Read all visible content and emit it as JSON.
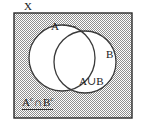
{
  "figure": {
    "type": "venn-diagram",
    "title_label": "X",
    "background_color": "#ffffff",
    "stroke_color": "#2a2a2a",
    "shade_color": "#9a9a9a",
    "circle_fill_color": "#ffffff"
  },
  "labels": {
    "universe": "X",
    "set_a": "A",
    "set_b": "B",
    "union": "A∪B",
    "complement_prefix": "A",
    "complement_sup_a": "c",
    "complement_operator": "∩",
    "complement_second": "B",
    "complement_sup_b": "c",
    "union_symbol": "∪",
    "intersection_symbol": "∩"
  },
  "geometry": {
    "rect": {
      "x": 14,
      "y": 13,
      "width": 118,
      "height": 105
    },
    "circle_a": {
      "cx": 62,
      "cy": 58,
      "r": 33
    },
    "circle_b": {
      "cx": 85,
      "cy": 62,
      "r": 31
    },
    "leader_a": {
      "x1": 63,
      "y1": 25,
      "x2": 76,
      "y2": 27
    },
    "leader_x": {
      "x1": 33,
      "y1": 8,
      "x2": 44,
      "y2": 12
    }
  }
}
